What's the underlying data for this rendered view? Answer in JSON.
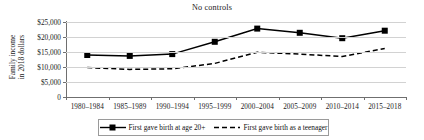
{
  "chart_data": {
    "type": "line",
    "title": "No controls",
    "xlabel": "",
    "ylabel": "Family income in 2018 dollars",
    "ylabel_line1": "Family income",
    "ylabel_line2": "in 2018 dollars",
    "categories": [
      "1980–1984",
      "1985–1989",
      "1990–1994",
      "1995–1999",
      "2000–2004",
      "2005–2009",
      "2010–2014",
      "2015–2018"
    ],
    "ylim": [
      0,
      25000
    ],
    "yticks": [
      0,
      5000,
      10000,
      15000,
      20000,
      25000
    ],
    "ytick_labels": [
      "0",
      "$5,000",
      "$10,000",
      "$15,000",
      "$20,000",
      "$25,000"
    ],
    "grid": true,
    "legend_position": "bottom",
    "series": [
      {
        "name": "First gave birth at age 20+",
        "style": "solid",
        "marker": "square",
        "color": "#000000",
        "values": [
          14000,
          13700,
          14300,
          18400,
          22800,
          21400,
          19600,
          22100
        ]
      },
      {
        "name": "First gave birth as a teenager",
        "style": "dashed",
        "marker": "none",
        "color": "#000000",
        "values": [
          9800,
          9200,
          9400,
          11200,
          14900,
          14300,
          13500,
          16200
        ]
      }
    ]
  },
  "legend": {
    "entry_0_label": "First gave birth at age 20+",
    "entry_1_label": "First gave birth as a teenager"
  }
}
